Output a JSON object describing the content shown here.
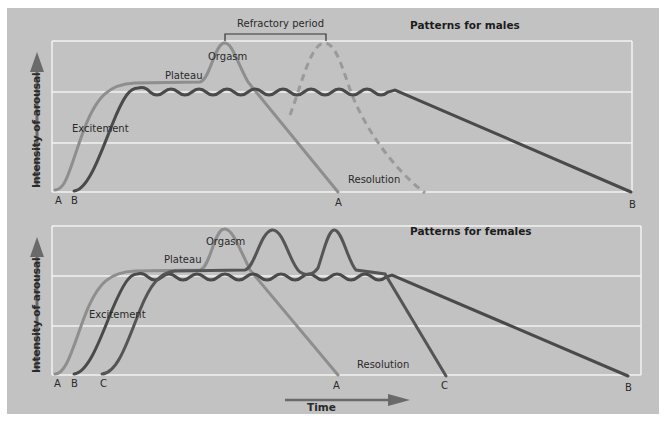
{
  "figure": {
    "males": {
      "title": "Patterns for males",
      "y_axis_label": "Intensity of arousal",
      "bracket_label": "Refractory period",
      "stage_labels": {
        "excitement": "Excitement",
        "plateau": "Plateau",
        "orgasm": "Orgasm",
        "resolution": "Resolution"
      },
      "endpoint_labels": {
        "start_a": "A",
        "start_b": "B",
        "end_a": "A",
        "end_b": "B"
      }
    },
    "females": {
      "title": "Patterns for females",
      "y_axis_label": "Intensity of arousal",
      "x_axis_label": "Time",
      "stage_labels": {
        "excitement": "Excitement",
        "plateau": "Plateau",
        "orgasm": "Orgasm",
        "resolution": "Resolution"
      },
      "endpoint_labels": {
        "start_a": "A",
        "start_b": "B",
        "start_c": "C",
        "end_a": "A",
        "end_c": "C",
        "end_b": "B"
      }
    }
  },
  "colors": {
    "background": "#c2c2c2",
    "grid": "#f2f2f2",
    "curve_a": "#8e8e8e",
    "curve_b": "#4a4a4a",
    "curve_c": "#555555",
    "text": "#2a2a2a"
  }
}
